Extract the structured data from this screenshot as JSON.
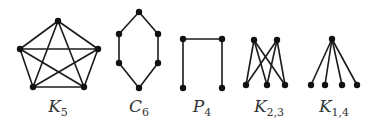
{
  "graphs": [
    {
      "id": "K5",
      "label": {
        "main": "K",
        "sub": "5",
        "x": 58
      },
      "vertices": [
        [
          58,
          21
        ],
        [
          20,
          49
        ],
        [
          98,
          49
        ],
        [
          33,
          87
        ],
        [
          84,
          87
        ]
      ],
      "edges": [
        [
          0,
          1
        ],
        [
          0,
          2
        ],
        [
          0,
          3
        ],
        [
          0,
          4
        ],
        [
          1,
          2
        ],
        [
          1,
          3
        ],
        [
          1,
          4
        ],
        [
          2,
          3
        ],
        [
          2,
          4
        ],
        [
          3,
          4
        ]
      ]
    },
    {
      "id": "C6",
      "label": {
        "main": "C",
        "sub": "6",
        "x": 139
      },
      "vertices": [
        [
          139,
          12
        ],
        [
          119,
          34
        ],
        [
          158,
          34
        ],
        [
          119,
          63
        ],
        [
          158,
          63
        ],
        [
          139,
          88
        ]
      ],
      "edges": [
        [
          0,
          1
        ],
        [
          0,
          2
        ],
        [
          1,
          3
        ],
        [
          2,
          4
        ],
        [
          3,
          5
        ],
        [
          4,
          5
        ]
      ]
    },
    {
      "id": "P4",
      "label": {
        "main": "P",
        "sub": "4",
        "x": 202
      },
      "vertices": [
        [
          183,
          39
        ],
        [
          222,
          39
        ],
        [
          183,
          88
        ],
        [
          222,
          88
        ]
      ],
      "edges": [
        [
          0,
          1
        ],
        [
          0,
          2
        ],
        [
          1,
          3
        ]
      ]
    },
    {
      "id": "K23",
      "label": {
        "main": "K",
        "sub": "2,3",
        "x": 269
      },
      "vertices": [
        [
          254,
          40
        ],
        [
          277,
          40
        ],
        [
          246,
          85
        ],
        [
          267,
          85
        ],
        [
          285,
          85
        ]
      ],
      "edges": [
        [
          0,
          2
        ],
        [
          0,
          3
        ],
        [
          0,
          4
        ],
        [
          1,
          2
        ],
        [
          1,
          3
        ],
        [
          1,
          4
        ]
      ]
    },
    {
      "id": "K14",
      "label": {
        "main": "K",
        "sub": "1,4",
        "x": 334
      },
      "vertices": [
        [
          332,
          39
        ],
        [
          311,
          85
        ],
        [
          325,
          85
        ],
        [
          342,
          85
        ],
        [
          357,
          85
        ]
      ],
      "edges": [
        [
          0,
          1
        ],
        [
          0,
          2
        ],
        [
          0,
          3
        ],
        [
          0,
          4
        ]
      ]
    }
  ],
  "colors": {
    "edge": "#1a1a1a",
    "vertex": "#111111",
    "label": "#333333"
  }
}
